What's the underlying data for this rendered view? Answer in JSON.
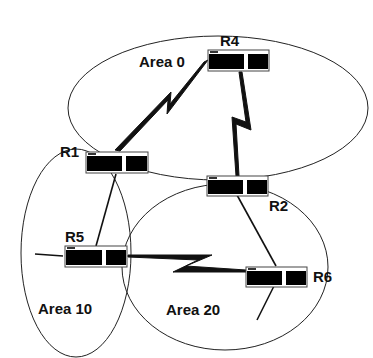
{
  "diagram": {
    "type": "OSPF multi-area network topology",
    "areas": [
      {
        "id": "area0",
        "label": "Area 0"
      },
      {
        "id": "area10",
        "label": "Area 10"
      },
      {
        "id": "area20",
        "label": "Area 20"
      }
    ],
    "routers": [
      {
        "id": "R1",
        "label": "R1"
      },
      {
        "id": "R2",
        "label": "R2"
      },
      {
        "id": "R4",
        "label": "R4"
      },
      {
        "id": "R5",
        "label": "R5"
      },
      {
        "id": "R6",
        "label": "R6"
      }
    ],
    "links": [
      {
        "from": "R1",
        "to": "R4",
        "kind": "serial (lightning)"
      },
      {
        "from": "R4",
        "to": "R2",
        "kind": "serial (lightning)"
      },
      {
        "from": "R5",
        "to": "R6",
        "kind": "serial (lightning)"
      },
      {
        "from": "R1",
        "to": "R5",
        "kind": "line"
      },
      {
        "from": "R2",
        "to": "R6",
        "kind": "line"
      }
    ],
    "colors": {
      "stroke": "#111111",
      "router_body": "#000000",
      "router_frame": "#555555",
      "background": "#ffffff"
    }
  }
}
